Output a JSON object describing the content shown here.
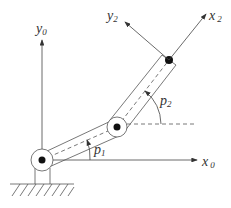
{
  "diagram": {
    "labels": {
      "y0": "y",
      "y0_sub": "0",
      "x0": "x",
      "x0_sub": "0",
      "y2": "y",
      "y2_sub": "2",
      "x2": "x",
      "x2_sub": "2",
      "p1": "p",
      "p1_sub": "1",
      "p2": "p",
      "p2_sub": "2"
    },
    "joints": [
      {
        "name": "base-joint",
        "x": 42,
        "y": 160
      },
      {
        "name": "elbow-joint",
        "x": 117,
        "y": 127
      },
      {
        "name": "end-effector",
        "x": 169,
        "y": 60
      }
    ],
    "colors": {
      "line": "#555555",
      "joint_fill": "#111111"
    }
  }
}
